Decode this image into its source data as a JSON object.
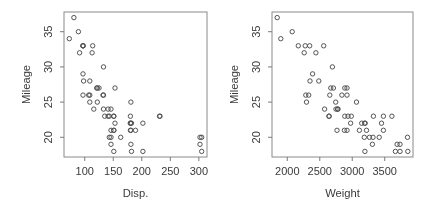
{
  "figure": {
    "background": "#ffffff"
  },
  "style": {
    "axis_color": "#8a8a8a",
    "tick_color": "#7a7a7a",
    "text_color": "#3a3a3a",
    "point_color": "#4c4c4c"
  },
  "chart_data": [
    {
      "type": "scatter",
      "title": "",
      "xlabel": "Disp.",
      "ylabel": "Mileage",
      "xlim": [
        63.7,
        314.3
      ],
      "ylim": [
        17.2,
        37.8
      ],
      "xticks": [
        100,
        150,
        200,
        250,
        300
      ],
      "yticks": [
        20,
        25,
        30,
        35
      ],
      "grid": false,
      "legend": null,
      "marker": "open-circle",
      "points": [
        [
          97,
          33
        ],
        [
          114,
          33
        ],
        [
          81,
          37
        ],
        [
          91,
          32
        ],
        [
          113,
          32
        ],
        [
          97,
          26
        ],
        [
          97,
          33
        ],
        [
          98,
          28
        ],
        [
          109,
          25
        ],
        [
          73,
          34
        ],
        [
          97,
          29
        ],
        [
          89,
          35
        ],
        [
          109,
          26
        ],
        [
          305,
          20
        ],
        [
          153,
          27
        ],
        [
          302,
          19
        ],
        [
          133,
          30
        ],
        [
          97,
          33
        ],
        [
          125,
          27
        ],
        [
          146,
          24
        ],
        [
          107,
          26
        ],
        [
          109,
          28
        ],
        [
          121,
          27
        ],
        [
          151,
          23
        ],
        [
          133,
          26
        ],
        [
          181,
          25
        ],
        [
          141,
          24
        ],
        [
          132,
          26
        ],
        [
          133,
          24
        ],
        [
          122,
          25
        ],
        [
          181,
          21
        ],
        [
          146,
          21
        ],
        [
          151,
          23
        ],
        [
          116,
          24
        ],
        [
          135,
          23
        ],
        [
          122,
          27
        ],
        [
          141,
          23
        ],
        [
          163,
          20
        ],
        [
          151,
          21
        ],
        [
          153,
          22
        ],
        [
          202,
          22
        ],
        [
          180,
          22
        ],
        [
          182,
          22
        ],
        [
          232,
          23
        ],
        [
          143,
          23
        ],
        [
          180,
          21
        ],
        [
          180,
          22
        ],
        [
          151,
          21
        ],
        [
          189,
          21
        ],
        [
          180,
          23
        ],
        [
          231,
          23
        ],
        [
          305,
          18
        ],
        [
          302,
          20
        ],
        [
          151,
          18
        ],
        [
          202,
          18
        ],
        [
          182,
          18
        ],
        [
          181,
          19
        ],
        [
          143,
          20
        ],
        [
          146,
          20
        ],
        [
          146,
          19
        ]
      ]
    },
    {
      "type": "scatter",
      "title": "",
      "xlabel": "Weight",
      "ylabel": "Mileage",
      "xlim": [
        1764.6,
        3935.4
      ],
      "ylim": [
        17.2,
        37.8
      ],
      "xticks": [
        2000,
        2500,
        3000,
        3500
      ],
      "yticks": [
        20,
        25,
        30,
        35
      ],
      "grid": false,
      "legend": null,
      "marker": "open-circle",
      "points": [
        [
          2560,
          33
        ],
        [
          2345,
          33
        ],
        [
          1845,
          37
        ],
        [
          2260,
          32
        ],
        [
          2440,
          32
        ],
        [
          2285,
          26
        ],
        [
          2275,
          33
        ],
        [
          2350,
          28
        ],
        [
          2295,
          25
        ],
        [
          1900,
          34
        ],
        [
          2390,
          29
        ],
        [
          2075,
          35
        ],
        [
          2330,
          26
        ],
        [
          3320,
          20
        ],
        [
          2885,
          27
        ],
        [
          3310,
          19
        ],
        [
          2695,
          30
        ],
        [
          2170,
          33
        ],
        [
          2710,
          27
        ],
        [
          2775,
          24
        ],
        [
          2840,
          26
        ],
        [
          2485,
          28
        ],
        [
          2670,
          27
        ],
        [
          2640,
          23
        ],
        [
          2655,
          26
        ],
        [
          3065,
          25
        ],
        [
          2750,
          24
        ],
        [
          2920,
          26
        ],
        [
          2780,
          24
        ],
        [
          2745,
          25
        ],
        [
          3110,
          21
        ],
        [
          2920,
          21
        ],
        [
          2645,
          23
        ],
        [
          2575,
          24
        ],
        [
          2935,
          23
        ],
        [
          2920,
          27
        ],
        [
          2985,
          23
        ],
        [
          3265,
          20
        ],
        [
          2880,
          21
        ],
        [
          2975,
          22
        ],
        [
          3450,
          22
        ],
        [
          3145,
          22
        ],
        [
          3190,
          22
        ],
        [
          3610,
          23
        ],
        [
          2885,
          23
        ],
        [
          3480,
          21
        ],
        [
          3200,
          22
        ],
        [
          2765,
          21
        ],
        [
          3220,
          21
        ],
        [
          3480,
          23
        ],
        [
          3325,
          23
        ],
        [
          3855,
          18
        ],
        [
          3850,
          20
        ],
        [
          3195,
          18
        ],
        [
          3735,
          18
        ],
        [
          3665,
          18
        ],
        [
          3735,
          19
        ],
        [
          3415,
          20
        ],
        [
          3185,
          20
        ],
        [
          3690,
          19
        ]
      ]
    }
  ]
}
